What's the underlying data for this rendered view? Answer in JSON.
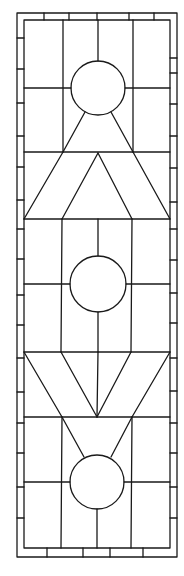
{
  "diagram": {
    "type": "stained-glass-pattern",
    "stroke_color": "#1a1a1a",
    "background": "#ffffff",
    "frame": {
      "outer": [
        17,
        13,
        177,
        557
      ],
      "inner": [
        24,
        20,
        170,
        548
      ]
    },
    "columns_x": [
      63,
      98,
      133
    ],
    "circles": [
      {
        "cx": 98,
        "cy": 88,
        "r": 27
      },
      {
        "cx": 98,
        "cy": 284,
        "r": 28
      },
      {
        "cx": 97,
        "cy": 482,
        "r": 27
      }
    ],
    "bands": {
      "triangle_top": 152,
      "triangle_base": 219,
      "v_top": 352,
      "v_bottom": 417
    }
  }
}
